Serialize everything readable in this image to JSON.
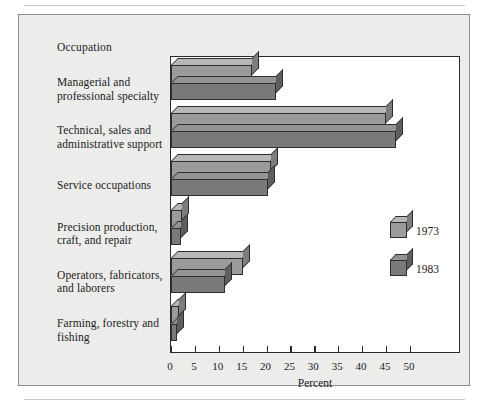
{
  "figure": {
    "panel_background": "#ececeb",
    "rule_color": "#c9c9c9"
  },
  "chart_data": {
    "type": "bar",
    "orientation": "horizontal",
    "title": "",
    "category_axis_title": "Occupation",
    "xlabel": "Percent",
    "ylabel": "",
    "xlim": [
      0,
      60.7
    ],
    "xticks": [
      0,
      5,
      10,
      15,
      20,
      25,
      30,
      35,
      40,
      45,
      50
    ],
    "xticklabels": [
      "0",
      "5",
      "10",
      "15",
      "20",
      "25",
      "30",
      "35",
      "40",
      "45",
      "50"
    ],
    "grid": false,
    "legend_position": "inside-right",
    "categories": [
      "Managerial and professional specialty",
      "Technical, sales and administrative support",
      "Service occupations",
      "Precision production, craft, and repair",
      "Operators, fabricators, and laborers",
      "Farming, forestry and fishing"
    ],
    "series": [
      {
        "name": "1973",
        "color": "#9b9b9b",
        "top_color": "#b8b8b8",
        "side_color": "#7d7d7d",
        "values": [
          17.0,
          45.0,
          21.0,
          2.2,
          15.0,
          1.6
        ]
      },
      {
        "name": "1983",
        "color": "#7a7a7a",
        "top_color": "#949494",
        "side_color": "#5e5e5e",
        "values": [
          22.0,
          47.0,
          20.2,
          2.1,
          11.4,
          1.2
        ]
      }
    ]
  },
  "legend": {
    "entries": [
      {
        "label": "1973"
      },
      {
        "label": "1983"
      }
    ]
  }
}
